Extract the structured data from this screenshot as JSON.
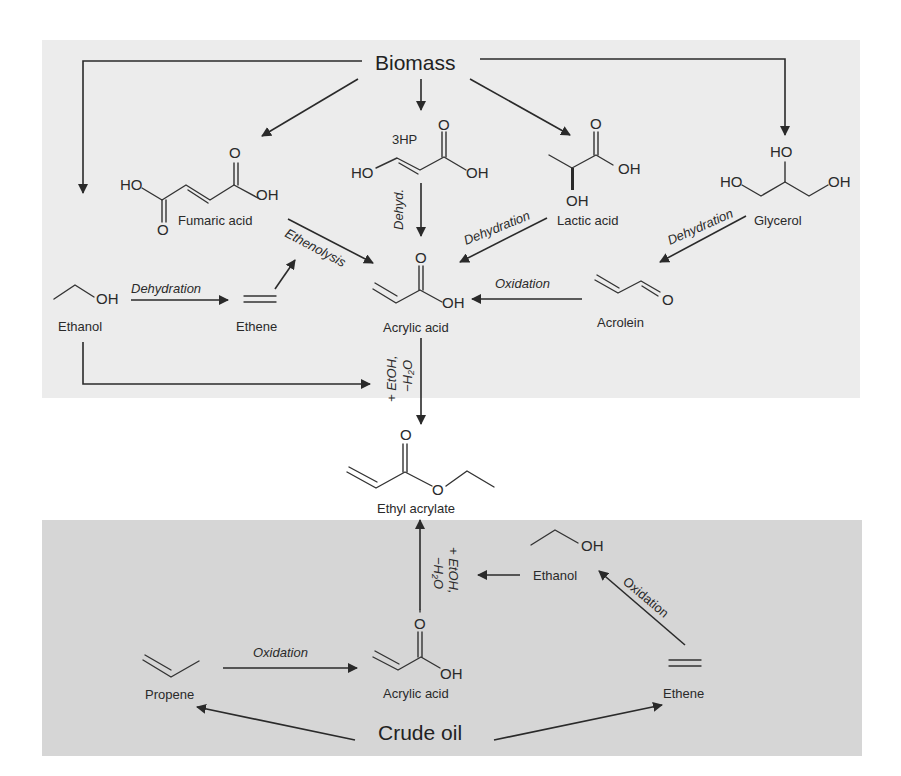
{
  "colors": {
    "top_panel_bg": "#ececec",
    "bottom_panel_bg": "#d6d6d6",
    "ink": "#2a2a2a"
  },
  "sources": {
    "biomass": "Biomass",
    "crude_oil": "Crude oil"
  },
  "biomass_route": {
    "compounds": {
      "fumaric_acid": "Fumaric acid",
      "hp3": "3HP",
      "lactic_acid": "Lactic acid",
      "glycerol": "Glycerol",
      "ethanol": "Ethanol",
      "ethene": "Ethene",
      "acrylic_acid": "Acrylic acid",
      "acrolein": "Acrolein"
    },
    "conditions": {
      "ethanol_to_ethene": "Dehydration",
      "ethenolysis": "Ethenolysis",
      "hp3_dehyd": "Dehyd.",
      "lactic_dehydration": "Dehydration",
      "glycerol_dehydration": "Dehydration",
      "acrolein_oxidation": "Oxidation",
      "esterification_line1": "+ EtOH,",
      "esterification_line2": "−H₂O"
    }
  },
  "product": {
    "name": "Ethyl acrylate"
  },
  "petro_route": {
    "compounds": {
      "propene": "Propene",
      "acrylic_acid": "Acrylic acid",
      "ethanol": "Ethanol",
      "ethene": "Ethene"
    },
    "conditions": {
      "propene_oxidation": "Oxidation",
      "ethene_oxidation": "Oxidation",
      "esterification_line1": "+ EtOH,",
      "esterification_line2": "−H₂O"
    }
  },
  "atoms": {
    "O": "O",
    "OH": "OH",
    "HO": "HO"
  }
}
